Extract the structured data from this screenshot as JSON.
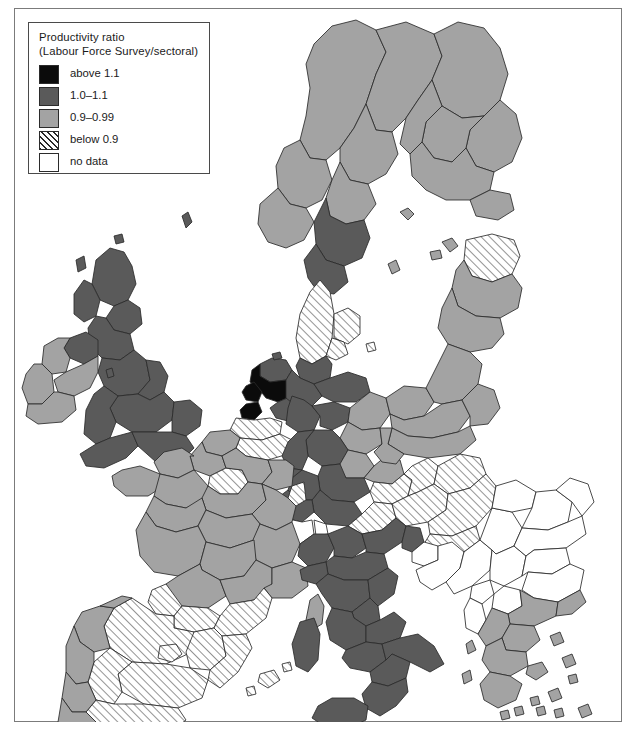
{
  "figure": {
    "kind": "choropleth-map",
    "region_coverage": "Europe (NUTS regions)"
  },
  "legend": {
    "title_line1": "Productivity ratio",
    "title_line2": "(Labour Force Survey/sectoral)",
    "items": [
      {
        "label": "above 1.1",
        "swatch": "solid-black",
        "color": "#0b0b0b"
      },
      {
        "label": "1.0–1.1",
        "swatch": "solid-dark-gray",
        "color": "#5a5a5a"
      },
      {
        "label": "0.9–0.99",
        "swatch": "solid-light-gray",
        "color": "#a3a3a3"
      },
      {
        "label": "below 0.9",
        "swatch": "diagonal-hatch",
        "color": "#ffffff"
      },
      {
        "label": "no data",
        "swatch": "empty-white",
        "color": "#ffffff"
      }
    ]
  },
  "map": {
    "stroke_color": "#2b2b2b",
    "background": "#ffffff",
    "classes": {
      "above": "#0b0b0b",
      "mid": "#5a5a5a",
      "low": "#a3a3a3",
      "below": "hatch",
      "nodata": "#ffffff"
    },
    "regions": [
      {
        "name": "Scotland",
        "class": "mid"
      },
      {
        "name": "Northern England",
        "class": "mid"
      },
      {
        "name": "Wales",
        "class": "mid"
      },
      {
        "name": "Southern England",
        "class": "mid"
      },
      {
        "name": "Northern Ireland",
        "class": "mid"
      },
      {
        "name": "Ireland",
        "class": "low"
      },
      {
        "name": "Norway (south)",
        "class": "low"
      },
      {
        "name": "Sweden (north)",
        "class": "low"
      },
      {
        "name": "Sweden (south)",
        "class": "mid"
      },
      {
        "name": "Finland",
        "class": "low"
      },
      {
        "name": "Denmark",
        "class": "below"
      },
      {
        "name": "Netherlands (Randstad)",
        "class": "above"
      },
      {
        "name": "Netherlands (other)",
        "class": "mid"
      },
      {
        "name": "Belgium",
        "class": "below"
      },
      {
        "name": "Luxembourg",
        "class": "mid"
      },
      {
        "name": "Germany (west)",
        "class": "mid"
      },
      {
        "name": "Germany (east)",
        "class": "low"
      },
      {
        "name": "Poland",
        "class": "low"
      },
      {
        "name": "Czechia / Slovakia",
        "class": "below"
      },
      {
        "name": "Austria",
        "class": "below"
      },
      {
        "name": "Hungary",
        "class": "below"
      },
      {
        "name": "Switzerland",
        "class": "nodata"
      },
      {
        "name": "France (most)",
        "class": "low"
      },
      {
        "name": "Ile-de-France",
        "class": "below"
      },
      {
        "name": "Northern Italy",
        "class": "mid"
      },
      {
        "name": "Southern Italy",
        "class": "mid"
      },
      {
        "name": "Sardinia",
        "class": "mid"
      },
      {
        "name": "Corsica",
        "class": "low"
      },
      {
        "name": "Sicily",
        "class": "mid"
      },
      {
        "name": "Spain",
        "class": "below"
      },
      {
        "name": "Portugal",
        "class": "low"
      },
      {
        "name": "Galicia",
        "class": "low"
      },
      {
        "name": "Greece",
        "class": "low"
      },
      {
        "name": "Balkans",
        "class": "nodata"
      },
      {
        "name": "Romania",
        "class": "nodata"
      },
      {
        "name": "Bulgaria",
        "class": "nodata"
      },
      {
        "name": "Baltic states",
        "class": "low"
      },
      {
        "name": "Estonia",
        "class": "below"
      }
    ]
  }
}
